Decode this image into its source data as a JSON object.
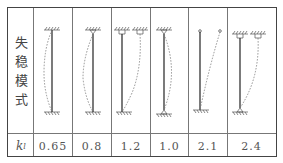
{
  "table": {
    "row_label": [
      "失",
      "稳",
      "模",
      "式"
    ],
    "k_label": "k",
    "k_sub": "l",
    "columns": [
      {
        "mode": "fixed-fixed",
        "k": "0.65"
      },
      {
        "mode": "fixed-pinned",
        "k": "0.8"
      },
      {
        "mode": "fixed-sliding-fixed",
        "k": "1.2"
      },
      {
        "mode": "pinned-pinned",
        "k": "1.0"
      },
      {
        "mode": "fixed-free",
        "k": "2.1"
      },
      {
        "mode": "sliding-pinned",
        "k": "2.4"
      }
    ]
  }
}
